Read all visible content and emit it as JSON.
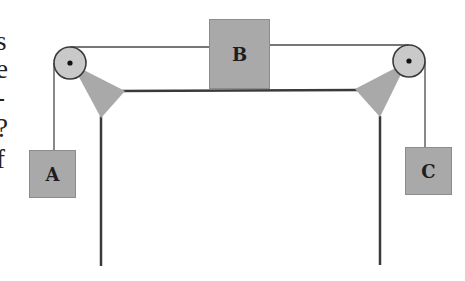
{
  "diagram": {
    "type": "pulley system",
    "blocks": {
      "A": {
        "label": "A",
        "position": "hanging left"
      },
      "B": {
        "label": "B",
        "position": "on table top"
      },
      "C": {
        "label": "C",
        "position": "hanging right"
      }
    },
    "pulleys": [
      {
        "name": "left-pulley",
        "cx": 70,
        "cy": 63,
        "r": 16
      },
      {
        "name": "right-pulley",
        "cx": 409,
        "cy": 61,
        "r": 16
      }
    ]
  },
  "edge_text": {
    "line1": "s",
    "line2": "e",
    "line3": "-",
    "line4": "?",
    "line5": "f"
  },
  "colors": {
    "block_fill": "#a9a9a9",
    "pulley_fill": "#c9c9c9",
    "line": "#3a3a3a"
  }
}
